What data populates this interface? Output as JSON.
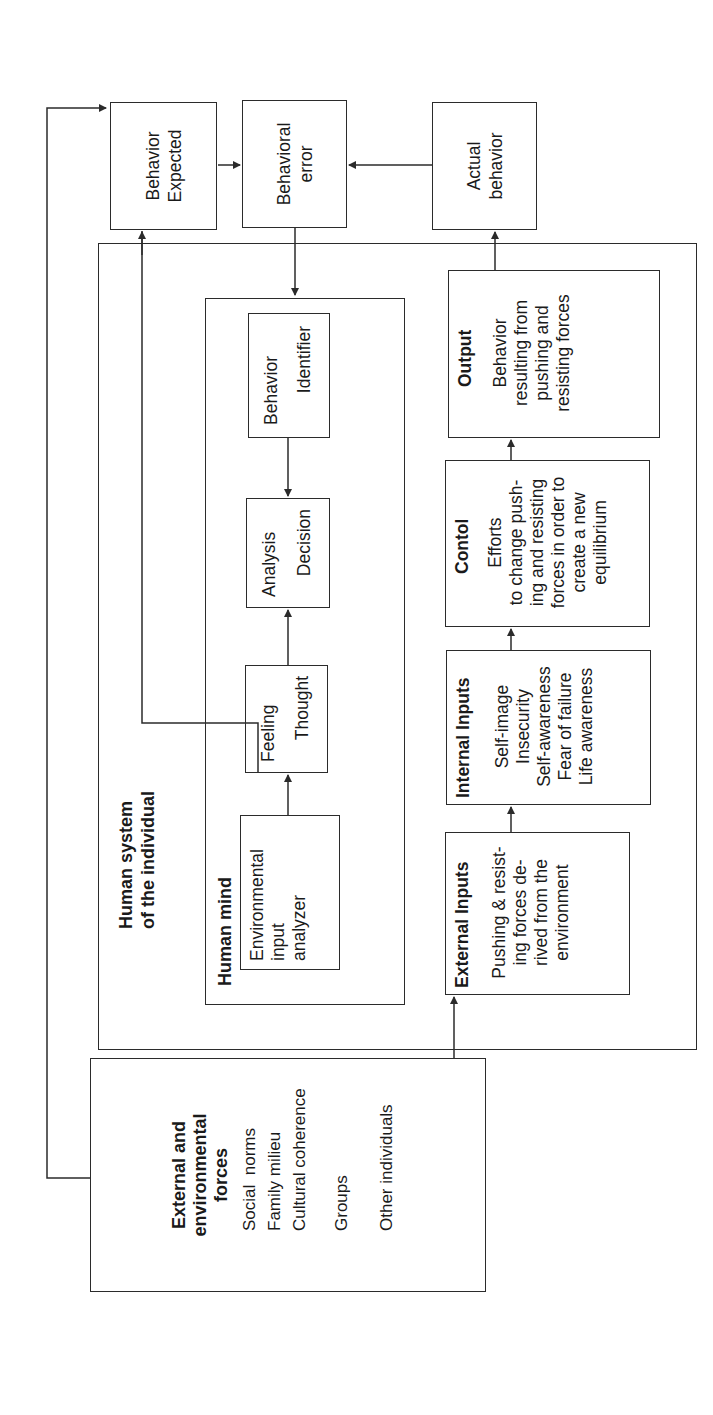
{
  "external_forces": {
    "title": "External and\nenvironmental\nforces",
    "items": [
      "Social  norms",
      "Family milieu",
      "Cultural coherence",
      "Groups",
      "Other individuals"
    ]
  },
  "human_system": {
    "title": "Human system\nof the individual",
    "human_mind": {
      "title": "Human mind",
      "env_analyzer": "Environmental\ninput\nanalyzer",
      "feeling_thought": [
        "Feeling",
        "Thought"
      ],
      "analysis_decision": [
        "Analysis",
        "Decision"
      ],
      "behavior_identifier": [
        "Behavior",
        "Identifier"
      ]
    },
    "external_inputs": {
      "title": "External Inputs",
      "body": "Pushing & resist-\ning forces de-\nrived from the\nenvironment"
    },
    "internal_inputs": {
      "title": "Internal Inputs",
      "body": "Self-image\nInsecurity\nSelf-awareness\nFear of failure\nLife awareness"
    },
    "control": {
      "title": "Contol",
      "body": "Efforts\nto change push-\ning and resisting\nforces in order to\ncreate a new\nequilibrium"
    },
    "output": {
      "title": "Output",
      "body": "Behavior\nresulting from\npushing and\nresisting forces"
    }
  },
  "behavior_expected": "Behavior\nExpected",
  "behavioral_error": "Behavioral\nerror",
  "actual_behavior": "Actual\nbehavior",
  "colors": {
    "line": "#2b2b2b",
    "text": "#1a1a1a",
    "background": "#ffffff"
  }
}
